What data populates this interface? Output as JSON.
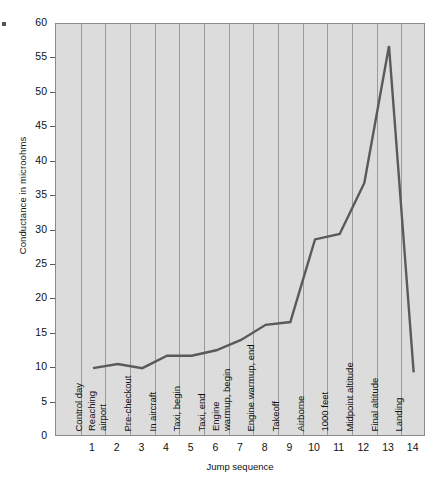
{
  "chart_data": {
    "type": "line",
    "title": "",
    "xlabel": "Jump sequence",
    "ylabel": "Conductance in microohms",
    "ylim": [
      0,
      60
    ],
    "yticks": [
      0,
      5,
      10,
      15,
      20,
      25,
      30,
      35,
      40,
      45,
      50,
      55,
      60
    ],
    "grid": "vertical",
    "legend": "none",
    "xticks": [
      1,
      2,
      3,
      4,
      5,
      6,
      7,
      8,
      9,
      10,
      11,
      12,
      13,
      14
    ],
    "categories": [
      "Control day",
      "Reaching\nairport",
      "Pre-checkout",
      "In aircraft",
      "Taxi, begin",
      "Taxi, end",
      "Engine\nwarmup, begin",
      "Engine warmup, end",
      "Takeoff",
      "Airborne",
      "1000 feet",
      "Midpoint altitude",
      "Final altitude",
      "Landing"
    ],
    "x": [
      1,
      2,
      3,
      4,
      5,
      6,
      7,
      8,
      9,
      10,
      11,
      12,
      13,
      14
    ],
    "values": [
      10.0,
      10.6,
      10.0,
      11.8,
      11.8,
      12.6,
      14.1,
      16.3,
      16.7,
      28.7,
      29.5,
      36.9,
      56.8,
      9.4
    ],
    "series": [
      {
        "name": "Conductance",
        "values": [
          10.0,
          10.6,
          10.0,
          11.8,
          11.8,
          12.6,
          14.1,
          16.3,
          16.7,
          28.7,
          29.5,
          36.9,
          56.8,
          9.4
        ]
      }
    ],
    "line_color": "#5a5a5a",
    "plot_background": "#dcdcdc"
  }
}
